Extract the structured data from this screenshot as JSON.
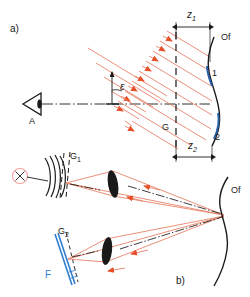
{
  "figure": {
    "panels": [
      {
        "id": "a",
        "label": "a)",
        "x": 10,
        "y": 24
      },
      {
        "id": "b",
        "label": "b)",
        "x": 176,
        "y": 276
      }
    ]
  },
  "panel_a": {
    "observer_label": "A",
    "observer_icon": "eye-icon",
    "angle_label": "ε",
    "grating_label": "G",
    "surface_label": "Of",
    "surface_point_1": "1",
    "surface_point_2": "2",
    "dimension_z1": {
      "symbol": "z",
      "subscript": "1"
    },
    "dimension_z2": {
      "symbol": "z",
      "subscript": "2"
    },
    "ray_count": 9,
    "ray_color": "#e8836a",
    "arrow_color": "#e8502a",
    "axis_style": "dash-dot"
  },
  "panel_b": {
    "source_icon": "point-source-icon",
    "grating_1_label": {
      "symbol": "G",
      "subscript": "1"
    },
    "grating_2_label": {
      "symbol": "G",
      "subscript": "2"
    },
    "film_label": "F",
    "surface_label": "Of",
    "lens_icon": "lens-icon",
    "lens_count": 2,
    "ray_color": "#e8836a",
    "arrow_color": "#e8502a",
    "film_color": "#2f7fd0"
  },
  "colors": {
    "ink": "#1a1a1a",
    "ray": "#e8836a",
    "arrow": "#e8502a",
    "blue": "#2f7fd0",
    "curve_blue": "#2b5fa8",
    "source_pink": "#f2a5a0",
    "background": "#ffffff"
  }
}
